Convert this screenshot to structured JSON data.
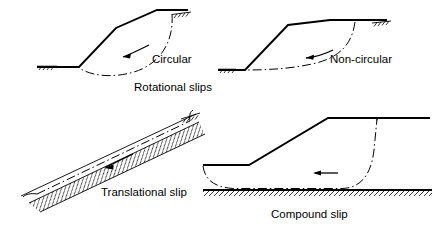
{
  "figure": {
    "background_color": "#ffffff",
    "line_color": "#000000",
    "width": 437,
    "height": 231
  },
  "panels": [
    {
      "id": "circular",
      "label": "Circular",
      "label_x": 152,
      "label_y": 60,
      "slip_type": "rotational",
      "movement_arrow": "curved-left",
      "ground_symbols": 2,
      "description": "Embankment with a circular arc slip surface from crest to toe"
    },
    {
      "id": "non-circular",
      "label": "Non-circular",
      "label_x": 330,
      "label_y": 60,
      "slip_type": "rotational",
      "movement_arrow": "curved-left",
      "ground_symbols": 2,
      "description": "Embankment with a non-circular rotational slip surface"
    },
    {
      "id": "translational",
      "label": "Translational slip",
      "label_x": 101,
      "label_y": 193,
      "slip_type": "translational",
      "movement_arrow": "straight-left-inclined",
      "ground_symbols": 1,
      "description": "Inclined slope over a hard stratum with a slip plane parallel to the surface"
    },
    {
      "id": "compound",
      "label": "Compound slip",
      "label_x": 271,
      "label_y": 215,
      "slip_type": "compound",
      "movement_arrow": "straight-left",
      "ground_symbols": 1,
      "description": "Embankment over a hard stratum with a part-curved, part-planar slip surface"
    }
  ],
  "group_captions": [
    {
      "id": "rotational-slips",
      "text": "Rotational slips",
      "label_x": 134,
      "label_y": 88
    }
  ],
  "labels": {
    "circular": "Circular",
    "non_circular": "Non-circular",
    "rotational_slips": "Rotational slips",
    "translational_slip": "Translational slip",
    "compound_slip": "Compound slip"
  }
}
